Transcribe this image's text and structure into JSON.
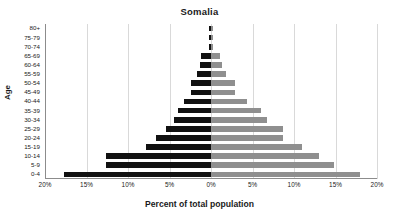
{
  "chart_data": {
    "type": "bar",
    "subtype": "population-pyramid",
    "title": "Somalia",
    "xlabel": "Percent of total population",
    "ylabel": "Age",
    "xlim": [
      -20,
      20
    ],
    "xticks": [
      -20,
      -15,
      -10,
      -5,
      0,
      5,
      10,
      15,
      20
    ],
    "xtick_labels": [
      "20%",
      "15%",
      "10%",
      "5%",
      "0%",
      "5%",
      "10%",
      "15%",
      "20%"
    ],
    "grid": true,
    "legend": null,
    "categories": [
      "0-4",
      "5-9",
      "10-14",
      "15-19",
      "20-24",
      "25-29",
      "30-34",
      "35-39",
      "40-44",
      "45-49",
      "50-54",
      "55-59",
      "60-64",
      "65-69",
      "70-74",
      "75-79",
      "80+"
    ],
    "series": [
      {
        "name": "Male",
        "side": "left",
        "color": "#111111",
        "values": [
          17.7,
          12.7,
          12.7,
          7.8,
          6.6,
          5.4,
          4.5,
          4.0,
          3.2,
          2.4,
          2.4,
          1.7,
          1.3,
          1.2,
          0.3,
          0.2,
          0.2
        ]
      },
      {
        "name": "Female",
        "side": "right",
        "color": "#8f8f8f",
        "values": [
          18.0,
          14.8,
          13.0,
          11.0,
          8.7,
          8.7,
          6.7,
          6.0,
          4.3,
          2.9,
          2.9,
          1.8,
          1.3,
          1.1,
          0.3,
          0.2,
          0.2
        ]
      }
    ]
  }
}
